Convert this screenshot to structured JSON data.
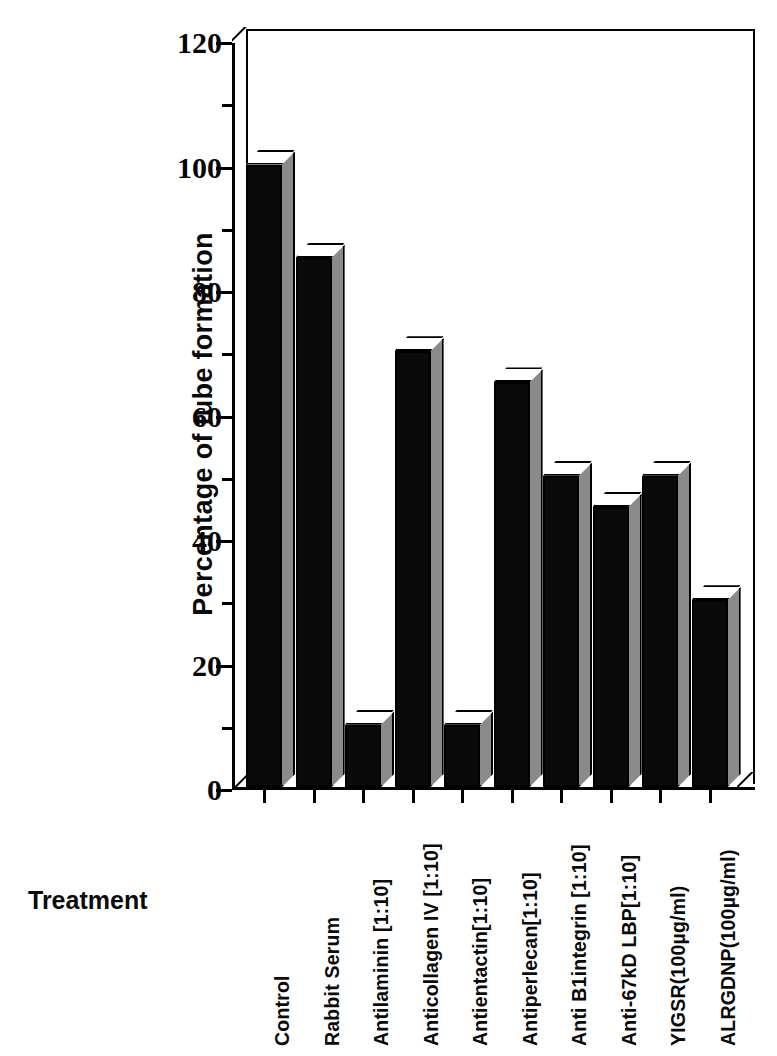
{
  "chart_data": {
    "type": "bar",
    "title": "",
    "xlabel": "Treatment",
    "ylabel": "Percentage of tube formation",
    "ylim": [
      0,
      120
    ],
    "y_ticks": [
      0,
      20,
      40,
      60,
      80,
      100,
      120
    ],
    "y_minor_ticks": [
      10,
      30,
      50,
      70,
      90,
      110
    ],
    "grid": false,
    "legend": "none",
    "style": "3d-block-bars",
    "bar_face_color": "#0a0a0a",
    "bar_side_color": "#8a8a8a",
    "bar_top_color": "#ffffff",
    "categories": [
      "Control",
      "Rabbit  Serum",
      "Antilaminin  [1:10]",
      "Anticollagen IV  [1:10]",
      "Antientactin[1:10]",
      "Antiperlecan[1:10]",
      "Anti  B1integrin  [1:10]",
      "Anti-67kD  LBP[1:10]",
      "YIGSR(100µg/ml)",
      "ALRGDNP(100µg/ml)"
    ],
    "values": [
      100,
      85,
      10,
      70,
      10,
      65,
      50,
      45,
      50,
      30
    ]
  },
  "axis": {
    "y_title": "Percentage of tube formation",
    "x_title": "Treatment",
    "y_tick_labels": [
      "120",
      "100",
      "80",
      "60",
      "40",
      "20",
      "0"
    ]
  }
}
